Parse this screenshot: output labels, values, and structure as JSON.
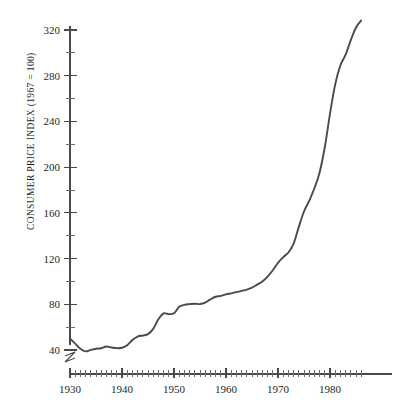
{
  "chart_data": {
    "type": "line",
    "title": "",
    "subtitle": "",
    "xlabel": "",
    "ylabel": "CONSUMER PRICE INDEX (1967 = 100)",
    "xlim": [
      1929,
      1987
    ],
    "ylim": [
      30,
      330
    ],
    "grid": false,
    "legend": null,
    "legend_position": "none",
    "axis_break": {
      "axis": "y",
      "below_value": 40,
      "note": "zigzag break mark on vertical axis beneath the 40 tick"
    },
    "y_ticks_labeled": [
      40,
      80,
      120,
      160,
      200,
      240,
      280,
      320
    ],
    "y_ticks_minor": [
      60,
      100,
      140,
      180,
      220,
      260,
      300
    ],
    "y_tick_labels": [
      "40",
      "80",
      "120",
      "160",
      "200",
      "240",
      "280",
      "320"
    ],
    "x_ticks_labeled": [
      1930,
      1940,
      1950,
      1960,
      1970,
      1980
    ],
    "x_tick_labels": [
      "1930",
      "1940",
      "1950",
      "1960",
      "1970",
      "1980"
    ],
    "x_tick_interval_minor": 1,
    "series": [
      {
        "name": "Consumer Price Index",
        "color": "#4a4a4a",
        "x": [
          1930,
          1931,
          1932,
          1933,
          1934,
          1935,
          1936,
          1937,
          1938,
          1939,
          1940,
          1941,
          1942,
          1943,
          1944,
          1945,
          1946,
          1947,
          1948,
          1949,
          1950,
          1951,
          1952,
          1953,
          1954,
          1955,
          1956,
          1957,
          1958,
          1959,
          1960,
          1961,
          1962,
          1963,
          1964,
          1965,
          1966,
          1967,
          1968,
          1969,
          1970,
          1971,
          1972,
          1973,
          1974,
          1975,
          1976,
          1977,
          1978,
          1979,
          1980,
          1981,
          1982,
          1983,
          1984,
          1985,
          1986
        ],
        "values": [
          50.0,
          45.6,
          41.0,
          38.8,
          40.1,
          41.1,
          41.5,
          43.0,
          42.2,
          41.6,
          42.0,
          44.1,
          48.8,
          51.8,
          52.7,
          53.9,
          58.5,
          66.9,
          72.1,
          71.4,
          72.1,
          77.8,
          79.5,
          80.1,
          80.5,
          80.2,
          81.4,
          84.3,
          86.6,
          87.3,
          88.7,
          89.6,
          90.6,
          91.7,
          92.9,
          94.5,
          97.2,
          100.0,
          104.2,
          109.8,
          116.3,
          121.3,
          125.3,
          133.1,
          147.7,
          161.2,
          170.5,
          181.5,
          195.4,
          217.4,
          246.8,
          272.4,
          289.1,
          298.4,
          311.1,
          322.2,
          328.4
        ]
      }
    ],
    "annotations": []
  },
  "figure": {
    "background_color": "#ffffff",
    "line_color": "#4a4a4a",
    "axis_color": "#4a4a4a",
    "text_color": "#1f1f1f"
  }
}
